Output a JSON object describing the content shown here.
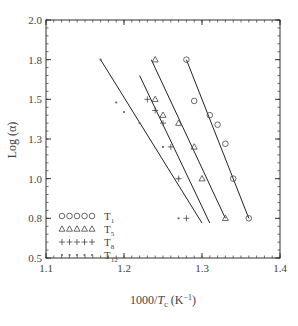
{
  "chart_data": {
    "type": "scatter",
    "title": "",
    "xlabel": "1000/T_c (K^-1)",
    "ylabel": "Log (α)",
    "xlim": [
      1.1,
      1.4
    ],
    "ylim": [
      0.5,
      2.0
    ],
    "x_ticks": [
      "1.1",
      "1.2",
      "1.3",
      "1.4"
    ],
    "y_ticks": [
      {
        "value": 0.5,
        "label": "0.5"
      },
      {
        "value": 0.75,
        "label": "0.8"
      },
      {
        "value": 1.0,
        "label": "1.0"
      },
      {
        "value": 1.25,
        "label": "1.3"
      },
      {
        "value": 1.5,
        "label": "1.5"
      },
      {
        "value": 1.75,
        "label": "1.8"
      },
      {
        "value": 2.0,
        "label": "2.0"
      }
    ],
    "grid": false,
    "legend_position": "lower left",
    "series": [
      {
        "name": "T1",
        "label_main": "T",
        "label_sub": "1",
        "marker": "circle",
        "points": [
          [
            1.28,
            1.75
          ],
          [
            1.29,
            1.49
          ],
          [
            1.31,
            1.4
          ],
          [
            1.32,
            1.34
          ],
          [
            1.33,
            1.22
          ],
          [
            1.34,
            1.0
          ],
          [
            1.36,
            0.75
          ]
        ],
        "fit": [
          [
            1.28,
            1.75
          ],
          [
            1.36,
            0.75
          ]
        ]
      },
      {
        "name": "T5",
        "label_main": "T",
        "label_sub": "5",
        "marker": "triangle",
        "points": [
          [
            1.24,
            1.75
          ],
          [
            1.24,
            1.5
          ],
          [
            1.25,
            1.4
          ],
          [
            1.27,
            1.35
          ],
          [
            1.29,
            1.2
          ],
          [
            1.3,
            1.0
          ],
          [
            1.33,
            0.75
          ]
        ],
        "fit": [
          [
            1.235,
            1.75
          ],
          [
            1.33,
            0.75
          ]
        ]
      },
      {
        "name": "T8",
        "label_main": "T",
        "label_sub": "8",
        "marker": "plus",
        "points": [
          [
            1.23,
            1.5
          ],
          [
            1.24,
            1.43
          ],
          [
            1.25,
            1.35
          ],
          [
            1.26,
            1.2
          ],
          [
            1.27,
            1.0
          ],
          [
            1.28,
            0.75
          ]
        ],
        "fit": [
          [
            1.22,
            1.65
          ],
          [
            1.31,
            0.72
          ]
        ]
      },
      {
        "name": "T12",
        "label_main": "T",
        "label_sub": "12",
        "marker": "asterisk",
        "points": [
          [
            1.17,
            1.75
          ],
          [
            1.19,
            1.48
          ],
          [
            1.2,
            1.42
          ],
          [
            1.22,
            1.35
          ],
          [
            1.25,
            1.2
          ],
          [
            1.27,
            1.0
          ],
          [
            1.27,
            0.75
          ]
        ],
        "fit": [
          [
            1.17,
            1.75
          ],
          [
            1.3,
            0.72
          ]
        ]
      }
    ]
  }
}
